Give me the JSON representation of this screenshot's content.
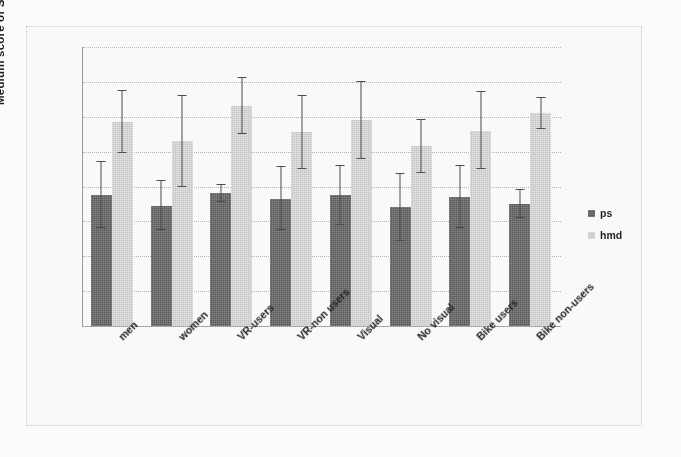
{
  "figure": {
    "background_color": "#ffffff",
    "frame_color": "#c9c9c9"
  },
  "legend": {
    "position": "right",
    "entries": [
      {
        "label": "ps",
        "color": "#595959",
        "icon": "legend-swatch"
      },
      {
        "label": "hmd",
        "color": "#c6c6c6",
        "icon": "legend-swatch"
      }
    ]
  },
  "axis": {
    "y_title": "Medium score of SoP",
    "y_ticks": [
      "80",
      "70",
      "60",
      "50",
      "40",
      "30",
      "20",
      "10",
      "0"
    ]
  },
  "chart_data": {
    "type": "bar",
    "title": "",
    "xlabel": "",
    "ylabel": "Medium score of SoP",
    "ylim": [
      0,
      80
    ],
    "ytick_step": 10,
    "grid": true,
    "legend_position": "right",
    "error_bars": "symmetric",
    "categories": [
      "men",
      "women",
      "VR-users",
      "VR-non users",
      "Visual",
      "No visual",
      "Bike users",
      "Bike non-users"
    ],
    "series": [
      {
        "name": "ps",
        "color": "#595959",
        "values": [
          37.5,
          34.5,
          38.0,
          36.5,
          37.5,
          34.0,
          37.0,
          35.0
        ],
        "errors": [
          9.5,
          7.0,
          2.5,
          9.0,
          8.5,
          9.5,
          9.0,
          4.0
        ]
      },
      {
        "name": "hmd",
        "color": "#c6c6c6",
        "values": [
          58.5,
          53.0,
          63.0,
          55.5,
          59.0,
          51.5,
          56.0,
          61.0
        ],
        "errors": [
          9.0,
          13.0,
          8.0,
          10.5,
          11.0,
          7.5,
          11.0,
          4.5
        ]
      }
    ]
  }
}
